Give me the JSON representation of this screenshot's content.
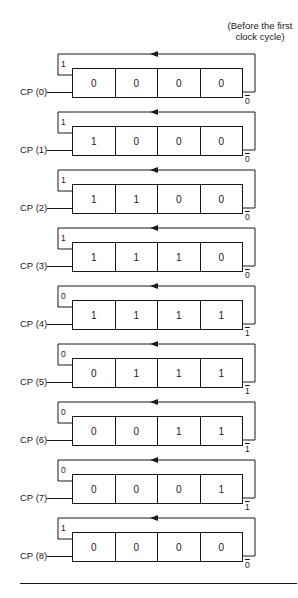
{
  "caption": "(Before the first clock cycle)",
  "caption_lines": [
    "(Before the first",
    "clock cycle)"
  ],
  "stages": [
    {
      "label": "CP (0)",
      "feedback_in": "1",
      "bits": [
        "0",
        "0",
        "0",
        "0"
      ],
      "complement_out": "0"
    },
    {
      "label": "CP (1)",
      "feedback_in": "1",
      "bits": [
        "1",
        "0",
        "0",
        "0"
      ],
      "complement_out": "0"
    },
    {
      "label": "CP (2)",
      "feedback_in": "1",
      "bits": [
        "1",
        "1",
        "0",
        "0"
      ],
      "complement_out": "0"
    },
    {
      "label": "CP (3)",
      "feedback_in": "1",
      "bits": [
        "1",
        "1",
        "1",
        "0"
      ],
      "complement_out": "0"
    },
    {
      "label": "CP (4)",
      "feedback_in": "0",
      "bits": [
        "1",
        "1",
        "1",
        "1"
      ],
      "complement_out": "1"
    },
    {
      "label": "CP (5)",
      "feedback_in": "0",
      "bits": [
        "0",
        "1",
        "1",
        "1"
      ],
      "complement_out": "1"
    },
    {
      "label": "CP (6)",
      "feedback_in": "0",
      "bits": [
        "0",
        "0",
        "1",
        "1"
      ],
      "complement_out": "1"
    },
    {
      "label": "CP (7)",
      "feedback_in": "0",
      "bits": [
        "0",
        "0",
        "0",
        "1"
      ],
      "complement_out": "1"
    },
    {
      "label": "CP (8)",
      "feedback_in": "1",
      "bits": [
        "0",
        "0",
        "0",
        "0"
      ],
      "complement_out": "0"
    }
  ]
}
